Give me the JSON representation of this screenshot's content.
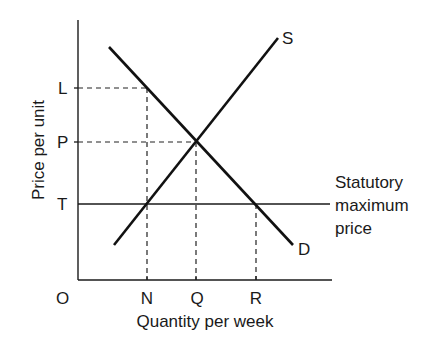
{
  "diagram": {
    "type": "supply-demand",
    "y_axis_label": "Price per unit",
    "x_axis_label": "Quantity per week",
    "origin_label": "O",
    "price_ticks": [
      {
        "label": "L"
      },
      {
        "label": "P"
      },
      {
        "label": "T"
      }
    ],
    "quantity_ticks": [
      {
        "label": "N"
      },
      {
        "label": "Q"
      },
      {
        "label": "R"
      }
    ],
    "curves": {
      "supply_label": "S",
      "demand_label": "D"
    },
    "price_ceiling": {
      "line1": "Statutory",
      "line2": "maximum",
      "line3": "price"
    },
    "colors": {
      "ink": "#111111",
      "background": "#ffffff"
    }
  }
}
